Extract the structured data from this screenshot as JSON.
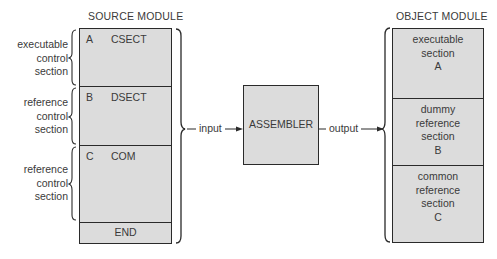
{
  "source_module": {
    "title": "SOURCE MODULE",
    "sections": [
      {
        "letter": "A",
        "name": "CSECT",
        "side_label": [
          "executable",
          "control",
          "section"
        ]
      },
      {
        "letter": "B",
        "name": "DSECT",
        "side_label": [
          "reference",
          "control",
          "section"
        ]
      },
      {
        "letter": "C",
        "name": "COM",
        "side_label": [
          "reference",
          "control",
          "section"
        ]
      },
      {
        "letter": "",
        "name": "END"
      }
    ]
  },
  "assembler": {
    "label": "ASSEMBLER"
  },
  "connectors": {
    "input_label": "input",
    "output_label": "output"
  },
  "object_module": {
    "title": "OBJECT MODULE",
    "sections": [
      {
        "lines": [
          "executable",
          "section",
          "A"
        ]
      },
      {
        "lines": [
          "dummy",
          "reference",
          "section",
          "B"
        ]
      },
      {
        "lines": [
          "common",
          "reference",
          "section",
          "C"
        ]
      }
    ]
  },
  "colors": {
    "box_fill": "#dcdcdc",
    "line": "#2a2a2a",
    "text": "#3a3a3a"
  }
}
